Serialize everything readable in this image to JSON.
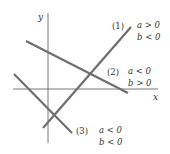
{
  "diagram": {
    "axes": {
      "x_label": "x",
      "y_label": "y"
    },
    "lines": [
      {
        "id": "1",
        "label": "(1)",
        "cond_a": "a > 0",
        "cond_b": "b < 0"
      },
      {
        "id": "2",
        "label": "(2)",
        "cond_a": "a < 0",
        "cond_b": "b > 0"
      },
      {
        "id": "3",
        "label": "(3)",
        "cond_a": "a < 0",
        "cond_b": "b < 0"
      }
    ],
    "colors": {
      "axis": "#555555",
      "line": "#6e6e6e",
      "text": "#333333"
    }
  }
}
